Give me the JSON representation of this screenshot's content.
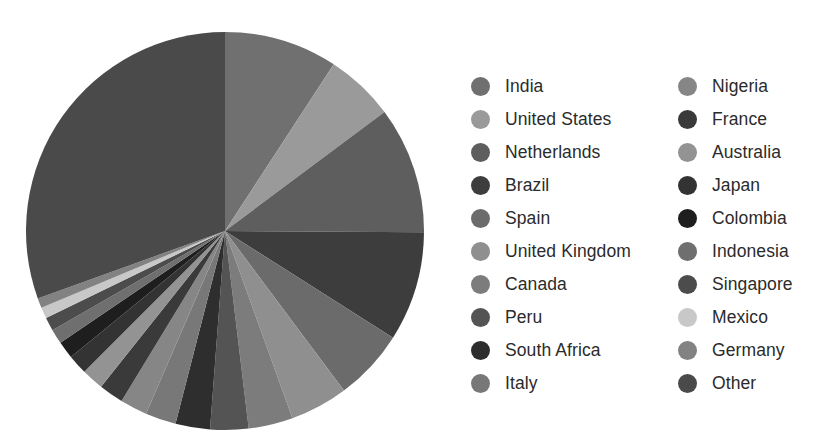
{
  "chart_data": {
    "type": "pie",
    "title": "",
    "subtitle": "",
    "xlabel": "",
    "ylabel": "",
    "legend_position": "right",
    "legend_columns": 2,
    "start_angle_deg": 0,
    "direction": "clockwise",
    "categories": [
      "India",
      "United States",
      "Netherlands",
      "Brazil",
      "Spain",
      "United Kingdom",
      "Canada",
      "Peru",
      "South Africa",
      "Italy",
      "Nigeria",
      "France",
      "Australia",
      "Japan",
      "Colombia",
      "Indonesia",
      "Singapore",
      "Mexico",
      "Germany",
      "Other"
    ],
    "values": [
      9.2,
      5.6,
      10.3,
      8.9,
      5.8,
      4.7,
      3.6,
      3.1,
      2.8,
      2.5,
      2.2,
      2.0,
      1.8,
      1.6,
      1.4,
      1.2,
      1.1,
      0.9,
      0.8,
      30.5
    ],
    "colors": [
      "#707070",
      "#9a9a9a",
      "#5e5e5e",
      "#3d3d3d",
      "#6b6b6b",
      "#8f8f8f",
      "#7c7c7c",
      "#545454",
      "#2e2e2e",
      "#787878",
      "#868686",
      "#3a3a3a",
      "#939393",
      "#333333",
      "#1e1e1e",
      "#6f6f6f",
      "#4c4c4c",
      "#c8c8c8",
      "#828282",
      "#4a4a4a"
    ],
    "units": "percent"
  },
  "legend": {
    "left_column": [
      {
        "label": "India",
        "color": "#707070"
      },
      {
        "label": "United States",
        "color": "#9a9a9a"
      },
      {
        "label": "Netherlands",
        "color": "#5e5e5e"
      },
      {
        "label": "Brazil",
        "color": "#3d3d3d"
      },
      {
        "label": "Spain",
        "color": "#6b6b6b"
      },
      {
        "label": "United Kingdom",
        "color": "#8f8f8f"
      },
      {
        "label": "Canada",
        "color": "#7c7c7c"
      },
      {
        "label": "Peru",
        "color": "#545454"
      },
      {
        "label": "South Africa",
        "color": "#2e2e2e"
      },
      {
        "label": "Italy",
        "color": "#787878"
      }
    ],
    "right_column": [
      {
        "label": "Nigeria",
        "color": "#868686"
      },
      {
        "label": "France",
        "color": "#3a3a3a"
      },
      {
        "label": "Australia",
        "color": "#939393"
      },
      {
        "label": "Japan",
        "color": "#333333"
      },
      {
        "label": "Colombia",
        "color": "#1e1e1e"
      },
      {
        "label": "Indonesia",
        "color": "#6f6f6f"
      },
      {
        "label": "Singapore",
        "color": "#4c4c4c"
      },
      {
        "label": "Mexico",
        "color": "#c8c8c8"
      },
      {
        "label": "Germany",
        "color": "#828282"
      },
      {
        "label": "Other",
        "color": "#4a4a4a"
      }
    ]
  },
  "pie_geometry": {
    "center_x": 200,
    "center_y": 200,
    "radius": 199
  }
}
